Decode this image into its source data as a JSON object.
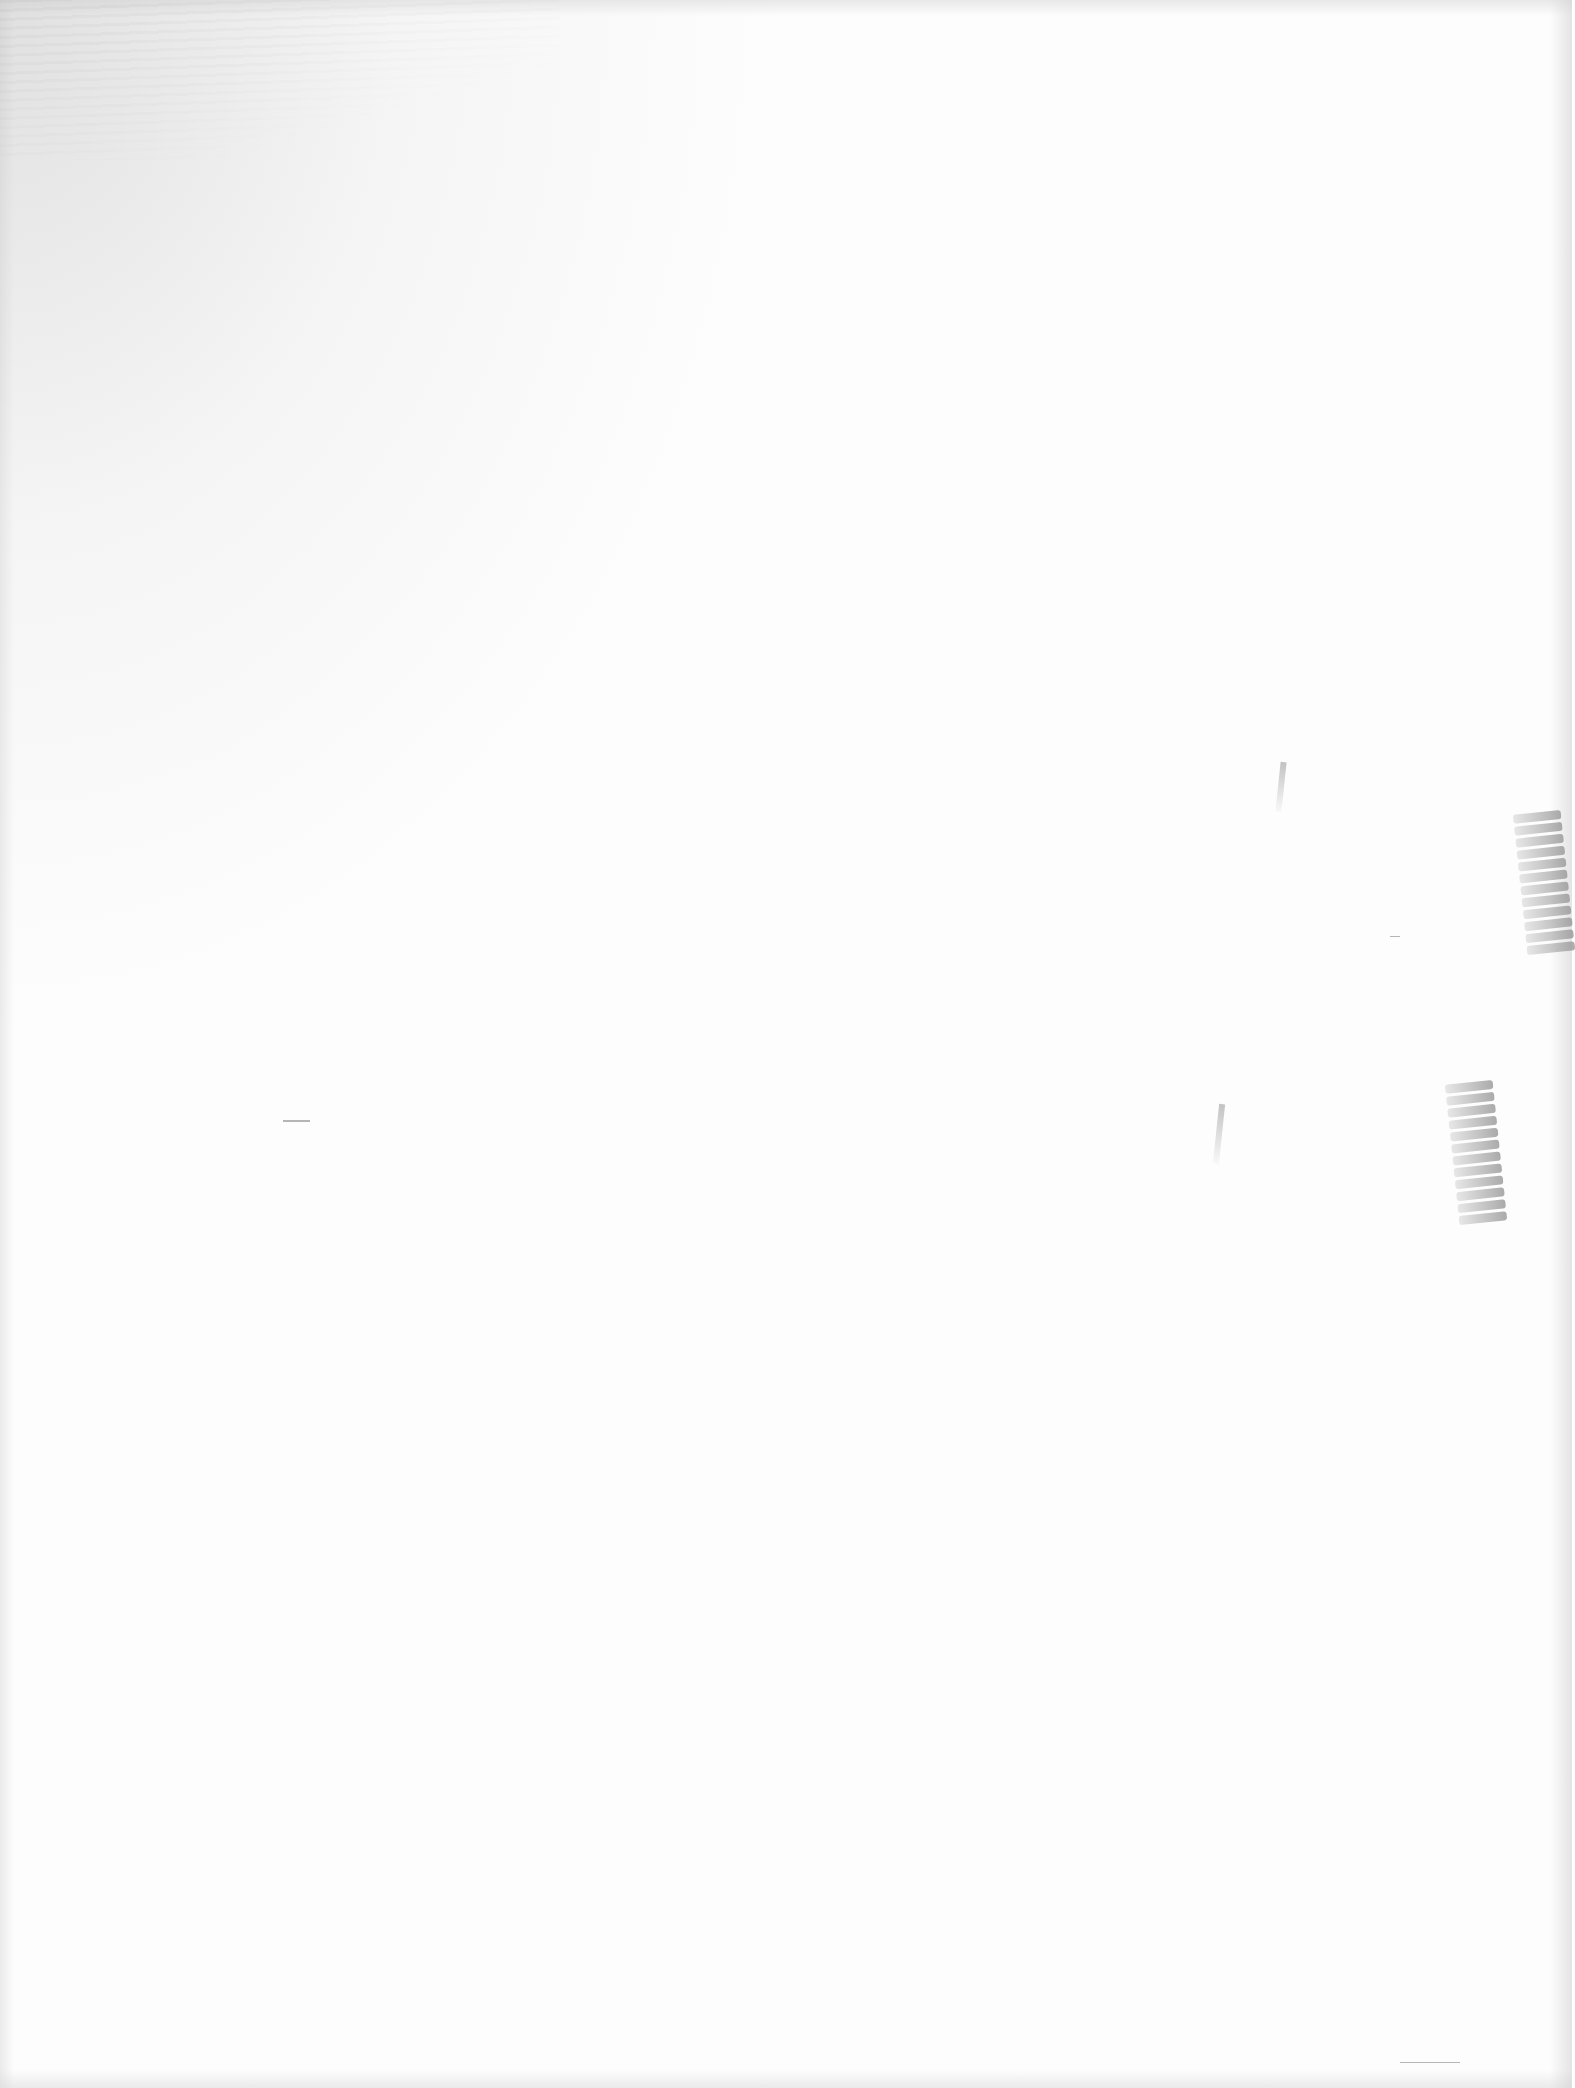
{
  "document": {
    "type": "scanned-blank-page",
    "text_content": "",
    "background_color": "#ffffff",
    "artifacts": [
      {
        "name": "top-left-bleed-through",
        "description": "faint reverse-side text bleed"
      },
      {
        "name": "right-edge-smudge-upper",
        "description": "stacked faint marks"
      },
      {
        "name": "right-edge-smudge-lower",
        "description": "stacked faint marks"
      },
      {
        "name": "stray-dash-left"
      },
      {
        "name": "stray-dash-bottom-right"
      }
    ]
  }
}
